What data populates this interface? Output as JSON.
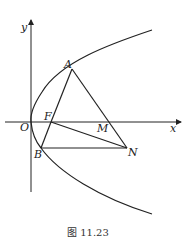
{
  "figure": {
    "caption": "图 11.23",
    "axes": {
      "x_label": "x",
      "y_label": "y",
      "origin_label": "O"
    },
    "points": {
      "A": {
        "label": "A"
      },
      "B": {
        "label": "B"
      },
      "F": {
        "label": "F"
      },
      "M": {
        "label": "M"
      },
      "N": {
        "label": "N"
      }
    },
    "curve": "parabola opening right, vertex at O",
    "segments": [
      "AF",
      "FB",
      "AN",
      "BN",
      "FN"
    ],
    "colors": {
      "stroke": "#222222",
      "background": "#ffffff"
    }
  }
}
